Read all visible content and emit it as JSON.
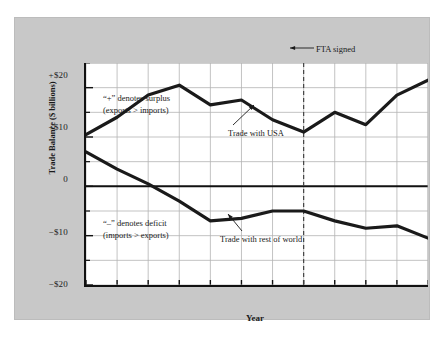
{
  "figure": {
    "background_color": "#ffffff",
    "panel_color": "#c8c8c8",
    "plot_background": "#ffffff",
    "line_color": "#1a1a1a",
    "grid_color": "#b4b4b4"
  },
  "chart_data": {
    "type": "line",
    "title": "",
    "xlabel": "Year",
    "ylabel": "Trade Balance ($ billions)",
    "categories": [
      "1982",
      "1983",
      "1984",
      "1985",
      "1986",
      "1987",
      "1988",
      "1989",
      "1990",
      "1991",
      "1992",
      "1993"
    ],
    "x": [
      1982,
      1983,
      1984,
      1985,
      1986,
      1987,
      1988,
      1989,
      1990,
      1991,
      1992,
      1993
    ],
    "ylim": [
      -20,
      25
    ],
    "xlim": [
      1982,
      1993
    ],
    "ytick_labels": [
      "+$20",
      "+$10",
      "0",
      "−$10",
      "−$20"
    ],
    "ytick_values": [
      20,
      10,
      0,
      -10,
      -20
    ],
    "xtick_labels": [
      "1982",
      "1983",
      "1984",
      "1985",
      "1986",
      "1987",
      "1988",
      "1989",
      "1990",
      "1991",
      "1992",
      "1993"
    ],
    "grid": true,
    "legend_position": "inline-annotations",
    "series": [
      {
        "name": "Trade with USA",
        "values": [
          10.5,
          14.0,
          18.5,
          20.5,
          16.5,
          17.5,
          13.5,
          11.0,
          15.0,
          12.5,
          18.5,
          21.5
        ]
      },
      {
        "name": "Trade with rest of world",
        "values": [
          7.0,
          3.5,
          0.5,
          -3.0,
          -7.0,
          -6.5,
          -5.0,
          -5.0,
          -7.0,
          -8.5,
          -8.0,
          -10.5
        ]
      }
    ],
    "annotations": [
      {
        "name": "surplus-note",
        "line1": "“+” denotes surplus",
        "line2": "(exports > imports)"
      },
      {
        "name": "deficit-note",
        "line1": "“–” denotes deficit",
        "line2": "(imports > exports)"
      },
      {
        "name": "usa-series-label",
        "text": "Trade with USA"
      },
      {
        "name": "row-series-label",
        "text": "Trade with rest of world"
      },
      {
        "name": "fta-event",
        "text": "FTA signed",
        "year": 1989
      }
    ],
    "event_line": {
      "label": "FTA signed",
      "year": 1989,
      "style": "dashed"
    }
  }
}
